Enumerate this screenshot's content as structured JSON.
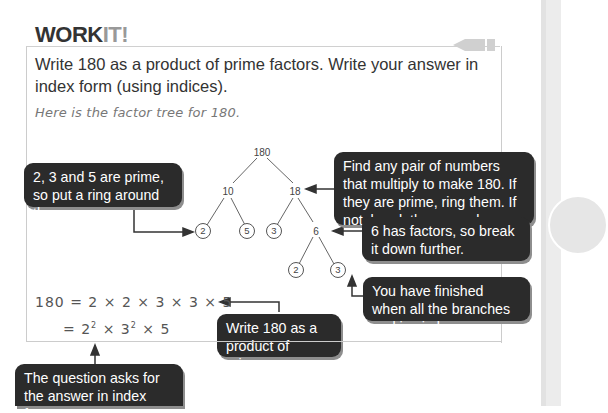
{
  "heading": {
    "bold": "WORK",
    "light": "IT!"
  },
  "question": "Write 180 as a product of prime factors. Write your answer in index form (using indices).",
  "intro": "Here is the factor tree for 180.",
  "factor_tree": {
    "root": "180",
    "level1": [
      "10",
      "18"
    ],
    "level2": [
      "2",
      "5",
      "3",
      "6"
    ],
    "level3": [
      "2",
      "3"
    ],
    "ringed": [
      "2",
      "5",
      "3",
      "2",
      "3"
    ]
  },
  "callouts": {
    "primes": "2, 3 and 5 are prime, so put a ring around them.",
    "find_pair": "Find any pair of numbers that multiply to make 180. If they are prime, ring them. If not, break these numbers down further.",
    "six_factors": "6 has factors, so break it down further.",
    "finished": "You have finished when all the branches end in circles.",
    "write_product": "Write 180 as a product of primes.",
    "index_form": "The question asks for the answer in index form."
  },
  "equations": {
    "line1": "180 = 2 × 2 × 3 × 3 × 5",
    "line2_prefix": "= 2",
    "line2_exp1": "2",
    "line2_mid": " × 3",
    "line2_exp2": "2",
    "line2_suffix": " × 5"
  },
  "colors": {
    "bubble": "#2b2b2b",
    "heading_light": "#999999",
    "side_band": "#e2e2e2"
  }
}
